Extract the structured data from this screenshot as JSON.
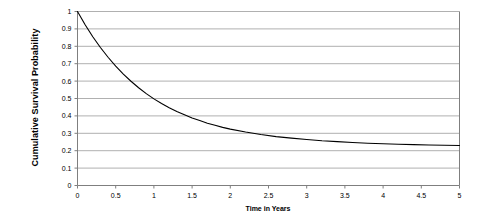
{
  "chart_data": {
    "type": "line",
    "title": "",
    "xlabel": "Time in Years",
    "ylabel": "Cumulative Survival Probability",
    "xlim": [
      0,
      5
    ],
    "ylim": [
      0,
      1
    ],
    "grid": true,
    "grid_axis": "y",
    "legend": false,
    "legend_position": "none",
    "line_color": "#000000",
    "grid_color": "#b0b0b0",
    "axis_color": "#808080",
    "background": "#ffffff",
    "xticks": [
      "0",
      "0.5",
      "1",
      "1.5",
      "2",
      "2.5",
      "3",
      "3.5",
      "4",
      "4.5",
      "5"
    ],
    "xtick_values": [
      0,
      0.5,
      1,
      1.5,
      2,
      2.5,
      3,
      3.5,
      4,
      4.5,
      5
    ],
    "yticks": [
      "0",
      "0.1",
      "0.2",
      "0.3",
      "0.4",
      "0.5",
      "0.6",
      "0.7",
      "0.8",
      "0.9",
      "1"
    ],
    "ytick_values": [
      0,
      0.1,
      0.2,
      0.3,
      0.4,
      0.5,
      0.6,
      0.7,
      0.8,
      0.9,
      1
    ],
    "series": [
      {
        "name": "Cumulative Survival Probability",
        "x": [
          0,
          0.1,
          0.2,
          0.3,
          0.4,
          0.5,
          0.6,
          0.7,
          0.8,
          0.9,
          1.0,
          1.1,
          1.2,
          1.3,
          1.4,
          1.5,
          1.6,
          1.7,
          1.8,
          1.9,
          2.0,
          2.2,
          2.4,
          2.6,
          2.8,
          3.0,
          3.2,
          3.4,
          3.6,
          3.8,
          4.0,
          4.2,
          4.4,
          4.6,
          4.8,
          5.0
        ],
        "values": [
          1.0,
          0.924,
          0.855,
          0.793,
          0.737,
          0.686,
          0.64,
          0.599,
          0.562,
          0.528,
          0.498,
          0.471,
          0.447,
          0.425,
          0.406,
          0.388,
          0.373,
          0.358,
          0.346,
          0.334,
          0.324,
          0.307,
          0.293,
          0.281,
          0.272,
          0.264,
          0.257,
          0.252,
          0.247,
          0.243,
          0.24,
          0.237,
          0.235,
          0.233,
          0.231,
          0.23
        ]
      }
    ]
  }
}
